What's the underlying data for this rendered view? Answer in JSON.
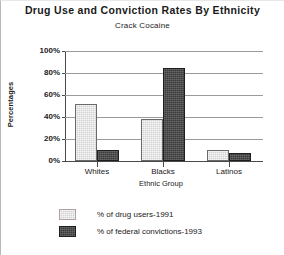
{
  "chart_data": {
    "type": "bar",
    "title": "Drug Use and Conviction Rates By Ethnicity",
    "subtitle": "Crack Cocaine",
    "xlabel": "Ethnic Group",
    "ylabel": "Percentages",
    "categories": [
      "Whites",
      "Blacks",
      "Latinos"
    ],
    "series": [
      {
        "name": "% of drug users-1991",
        "values": [
          52,
          38,
          10
        ],
        "color": "#d2d2d2"
      },
      {
        "name": "% of federal convictions-1993",
        "values": [
          10,
          85,
          7
        ],
        "color": "#3b3b3b"
      }
    ],
    "ylim": [
      0,
      100
    ],
    "ytick_labels": [
      "100%",
      "80%",
      "60%",
      "40%",
      "20%",
      "0%"
    ],
    "ytick_values": [
      100,
      80,
      60,
      40,
      20,
      0
    ],
    "grid": true,
    "legend_position": "bottom"
  }
}
